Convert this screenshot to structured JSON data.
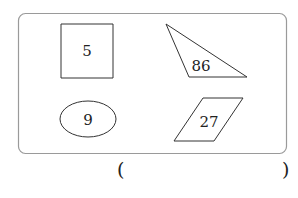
{
  "diagram": {
    "frame": {
      "x": 18,
      "y": 13,
      "width": 268,
      "height": 140,
      "radius": 7,
      "stroke": "#9a9a9a"
    },
    "shapes": [
      {
        "type": "square",
        "label": "5",
        "points": "61,24 113,24 113,78 61,78",
        "label_x": 87,
        "label_y": 56
      },
      {
        "type": "triangle",
        "label": "86",
        "points": "166,24 189,77 247,77",
        "label_x": 201,
        "label_y": 71
      },
      {
        "type": "ellipse",
        "label": "9",
        "cx": 88,
        "cy": 119,
        "rx": 28,
        "ry": 18,
        "label_x": 88,
        "label_y": 125
      },
      {
        "type": "parallelogram",
        "label": "27",
        "points": "203,98 243,98 214,141 174,141",
        "label_x": 209,
        "label_y": 127
      }
    ],
    "stroke_color": "#333333"
  },
  "answer": {
    "open_paren": "(",
    "close_paren": ")",
    "value": ""
  }
}
